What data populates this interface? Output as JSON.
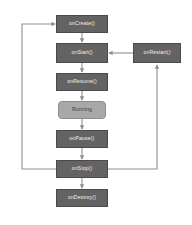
{
  "diagram": {
    "background_color": "#ffffff",
    "node_fill": "#636363",
    "node_stroke": "#4a4a4a",
    "node_text_color": "#efefef",
    "running_fill": "#a8a8a8",
    "running_stroke": "#8d8d8d",
    "running_text_color": "#3a3a3a",
    "edge_color": "#8f8f8f",
    "nodes": [
      {
        "id": "oncreate",
        "label": "onCreate()",
        "x": 56,
        "y": 15,
        "w": 52,
        "h": 18,
        "shape": "rect"
      },
      {
        "id": "onstart",
        "label": "onStart()",
        "x": 56,
        "y": 43,
        "w": 52,
        "h": 20,
        "shape": "rect"
      },
      {
        "id": "onresume",
        "label": "onResume()",
        "x": 56,
        "y": 73,
        "w": 52,
        "h": 18,
        "shape": "rect"
      },
      {
        "id": "running",
        "label": "Running",
        "x": 58,
        "y": 101,
        "w": 48,
        "h": 18,
        "shape": "rounded"
      },
      {
        "id": "onpause",
        "label": "onPause()",
        "x": 56,
        "y": 130,
        "w": 52,
        "h": 18,
        "shape": "rect"
      },
      {
        "id": "onstop",
        "label": "onStop()",
        "x": 56,
        "y": 160,
        "w": 52,
        "h": 18,
        "shape": "rect"
      },
      {
        "id": "ondestroy",
        "label": "onDestroy()",
        "x": 56,
        "y": 189,
        "w": 52,
        "h": 18,
        "shape": "rect"
      },
      {
        "id": "onrestart",
        "label": "onRestart()",
        "x": 133,
        "y": 43,
        "w": 48,
        "h": 20,
        "shape": "rect"
      }
    ],
    "edges": [
      {
        "from": "oncreate",
        "to": "onstart",
        "kind": "straight-down"
      },
      {
        "from": "onstart",
        "to": "onresume",
        "kind": "straight-down"
      },
      {
        "from": "onresume",
        "to": "running",
        "kind": "straight-down"
      },
      {
        "from": "running",
        "to": "onpause",
        "kind": "straight-down"
      },
      {
        "from": "onpause",
        "to": "onstop",
        "kind": "straight-down"
      },
      {
        "from": "onstop",
        "to": "ondestroy",
        "kind": "straight-down"
      },
      {
        "from": "onstop",
        "to": "oncreate",
        "kind": "left-loop"
      },
      {
        "from": "onstop",
        "to": "onrestart",
        "kind": "right-loop-up"
      },
      {
        "from": "onrestart",
        "to": "onstart",
        "kind": "right-to-left"
      }
    ]
  }
}
